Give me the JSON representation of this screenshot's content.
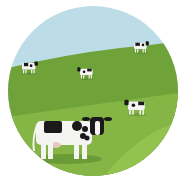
{
  "illustration": {
    "subject": "Holstein cows grazing on a green hillside",
    "colors": {
      "sky": "#bcdde8",
      "hill_far": "#6fa33a",
      "hill_near": "#84b545",
      "hill_light": "#93c24f",
      "cow_white": "#f4f4f2",
      "cow_black": "#1a1a1a",
      "udder": "#e8c7c0",
      "background": "#ffffff"
    },
    "cows": [
      {
        "id": "cow-top-right",
        "x": 134,
        "y": 40,
        "scale": 0.45
      },
      {
        "id": "cow-left",
        "x": 22,
        "y": 60,
        "scale": 0.48
      },
      {
        "id": "cow-middle",
        "x": 80,
        "y": 66,
        "scale": 0.45
      },
      {
        "id": "cow-right",
        "x": 128,
        "y": 98,
        "scale": 0.6
      },
      {
        "id": "cow-foreground",
        "x": 36,
        "y": 113,
        "scale": 1.0
      }
    ]
  }
}
